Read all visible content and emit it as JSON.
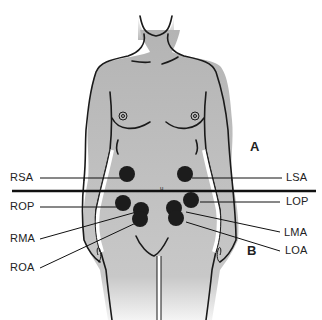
{
  "figure": {
    "left_labels": [
      {
        "id": "rsa",
        "text": "RSA"
      },
      {
        "id": "rop",
        "text": "ROP"
      },
      {
        "id": "rma",
        "text": "RMA"
      },
      {
        "id": "roa",
        "text": "ROA"
      }
    ],
    "right_labels": [
      {
        "id": "lsa",
        "text": "LSA"
      },
      {
        "id": "lop",
        "text": "LOP"
      },
      {
        "id": "lma",
        "text": "LMA"
      },
      {
        "id": "loa",
        "text": "LOA"
      }
    ],
    "region_above": "A",
    "region_below": "B",
    "colors": {
      "body": "#b9b9b9",
      "outline": "#1a1a1a",
      "spot": "#1c1c1c"
    }
  }
}
